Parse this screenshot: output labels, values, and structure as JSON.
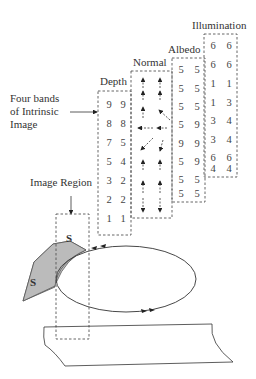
{
  "labels": {
    "illumination": "Illumination",
    "albedo": "Albedo",
    "normal": "Normal",
    "depth": "Depth",
    "four_bands_line1": "Four bands",
    "four_bands_line2": "of Intrinsic",
    "four_bands_line3": "Image",
    "image_region": "Image Region",
    "s_top": "S",
    "s_left": "S"
  },
  "bands": {
    "depth": [
      [
        "9",
        "9"
      ],
      [
        "8",
        "8"
      ],
      [
        "7",
        "5"
      ],
      [
        "5",
        "4"
      ],
      [
        "3",
        "2"
      ],
      [
        "2",
        "2"
      ],
      [
        "1",
        "1"
      ],
      [
        "0",
        "0"
      ]
    ],
    "albedo": [
      [
        "5",
        "5"
      ],
      [
        "5",
        "5"
      ],
      [
        "5",
        "5"
      ],
      [
        "5",
        "9"
      ],
      [
        "9",
        "9"
      ],
      [
        "5",
        "9"
      ],
      [
        "5",
        "5"
      ],
      [
        "5",
        "5"
      ]
    ],
    "illumination": [
      [
        "6",
        "6"
      ],
      [
        "6",
        "6"
      ],
      [
        "1",
        "1"
      ],
      [
        "1",
        "3"
      ],
      [
        "3",
        "4"
      ],
      [
        "3",
        "4"
      ],
      [
        "6",
        "6"
      ],
      [
        "4",
        "4"
      ]
    ],
    "normal": [
      "up",
      "up",
      "up",
      "up",
      "up",
      "up-left",
      "left",
      "left",
      "down-left",
      "down",
      "up",
      "up",
      "up",
      "up",
      "down",
      "down"
    ]
  },
  "colors": {
    "line": "#333333",
    "dash": "#555555",
    "shade": "#bbbbbb"
  }
}
